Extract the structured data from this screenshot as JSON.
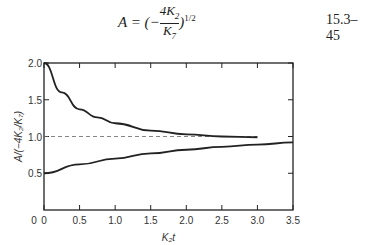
{
  "equation": {
    "text": "A = (−4K₂/K₇)^1/2",
    "number": "15.3–45"
  },
  "chart_data": {
    "type": "line",
    "title": "",
    "xlabel": "K₂t",
    "ylabel": "A/(−4K₂/K₇)",
    "xlim": [
      0,
      3.5
    ],
    "ylim": [
      0,
      2.0
    ],
    "xticks": [
      "0",
      "0.5",
      "1.0",
      "1.5",
      "2.0",
      "2.5",
      "3.0",
      "3.5"
    ],
    "yticks": [
      "0.5",
      "1.0",
      "1.5",
      "2.0"
    ],
    "reference_line": {
      "y": 1.0,
      "style": "dashed"
    },
    "series": [
      {
        "name": "upper",
        "x": [
          0,
          0.25,
          0.5,
          0.75,
          1.0,
          1.5,
          2.0,
          2.5,
          3.0
        ],
        "values": [
          2.0,
          1.6,
          1.37,
          1.26,
          1.18,
          1.08,
          1.03,
          1.0,
          0.99
        ]
      },
      {
        "name": "lower",
        "x": [
          0,
          0.5,
          1.0,
          1.5,
          2.0,
          2.5,
          3.0,
          3.5
        ],
        "values": [
          0.5,
          0.62,
          0.7,
          0.77,
          0.82,
          0.86,
          0.89,
          0.92
        ]
      }
    ]
  }
}
